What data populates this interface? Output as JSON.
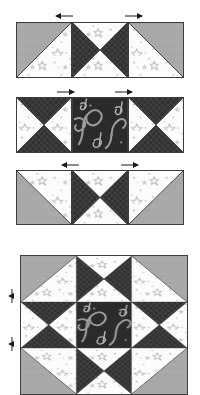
{
  "diagram": {
    "canvas": {
      "width": 200,
      "height": 387,
      "background": "#ffffff"
    }
  },
  "palette": {
    "solid_gray": "#a9a9a9",
    "solid_gray_shadow": "#9a9a9a",
    "white_star_print": "#fbfbfb",
    "star_motif": "#b9b9b9",
    "dark_print": "#3b3b3b",
    "dark_print_texture": "#2a2a2a",
    "music_print_bg": "#2e2e2e",
    "music_print_motif": "#9e9e9e",
    "outline": "#3c3c3c",
    "arrow": "#1a1a1a"
  },
  "fabrics": [
    {
      "id": "gray",
      "name": "solid gray",
      "color": "#a9a9a9"
    },
    {
      "id": "white",
      "name": "white star print",
      "color": "#fbfbfb"
    },
    {
      "id": "dark",
      "name": "dark textured print",
      "color": "#3b3b3b"
    },
    {
      "id": "music",
      "name": "music note print",
      "color": "#2e2e2e"
    }
  ],
  "rows": [
    {
      "id": "row-1",
      "label": "Row 1",
      "y": 22,
      "height": 56,
      "units": [
        {
          "id": "r1-u1",
          "type": "half-square-triangle",
          "name": "half-square-triangle-gray-upper-left",
          "x": 16,
          "width": 56,
          "triangles": [
            {
              "position": "upper-left",
              "fabric": "gray"
            },
            {
              "position": "lower-right",
              "fabric": "white"
            }
          ]
        },
        {
          "id": "r1-u2",
          "type": "hourglass",
          "name": "hourglass-dark-left-right",
          "x": 72,
          "width": 56,
          "triangles": [
            {
              "position": "left",
              "fabric": "dark"
            },
            {
              "position": "right",
              "fabric": "dark"
            },
            {
              "position": "top",
              "fabric": "white"
            },
            {
              "position": "bottom",
              "fabric": "white"
            }
          ]
        },
        {
          "id": "r1-u3",
          "type": "half-square-triangle",
          "name": "half-square-triangle-gray-upper-right",
          "x": 128,
          "width": 56,
          "triangles": [
            {
              "position": "upper-right",
              "fabric": "gray"
            },
            {
              "position": "lower-left",
              "fabric": "white"
            }
          ]
        }
      ],
      "press_arrows": [
        {
          "id": "row-1-arrow-left",
          "direction": "left",
          "x": 58,
          "y": 17
        },
        {
          "id": "row-1-arrow-right",
          "direction": "right",
          "x": 128,
          "y": 17
        }
      ]
    },
    {
      "id": "row-2",
      "label": "Row 2",
      "y": 97,
      "height": 56,
      "units": [
        {
          "id": "r2-u1",
          "type": "hourglass",
          "name": "hourglass-dark-top-bottom-left",
          "x": 16,
          "width": 56,
          "triangles": [
            {
              "position": "top",
              "fabric": "dark"
            },
            {
              "position": "bottom",
              "fabric": "dark"
            },
            {
              "position": "left",
              "fabric": "white"
            },
            {
              "position": "right",
              "fabric": "white"
            }
          ]
        },
        {
          "id": "r2-u2",
          "type": "plain-square",
          "name": "center-square-music-print",
          "x": 72,
          "width": 56,
          "triangles": [
            {
              "position": "whole",
              "fabric": "music"
            }
          ]
        },
        {
          "id": "r2-u3",
          "type": "hourglass",
          "name": "hourglass-dark-top-bottom-right",
          "x": 128,
          "width": 56,
          "triangles": [
            {
              "position": "top",
              "fabric": "dark"
            },
            {
              "position": "bottom",
              "fabric": "dark"
            },
            {
              "position": "left",
              "fabric": "white"
            },
            {
              "position": "right",
              "fabric": "white"
            }
          ]
        }
      ],
      "press_arrows": [
        {
          "id": "row-2-arrow-right-a",
          "direction": "right",
          "x": 60,
          "y": 92
        },
        {
          "id": "row-2-arrow-right-b",
          "direction": "right",
          "x": 118,
          "y": 92
        }
      ]
    },
    {
      "id": "row-3",
      "label": "Row 3",
      "y": 170,
      "height": 55,
      "units": [
        {
          "id": "r3-u1",
          "type": "half-square-triangle",
          "name": "half-square-triangle-gray-lower-left",
          "x": 16,
          "width": 56,
          "triangles": [
            {
              "position": "lower-left",
              "fabric": "gray"
            },
            {
              "position": "upper-right",
              "fabric": "white"
            }
          ]
        },
        {
          "id": "r3-u2",
          "type": "hourglass",
          "name": "hourglass-dark-left-right-lower",
          "x": 72,
          "width": 56,
          "triangles": [
            {
              "position": "left",
              "fabric": "dark"
            },
            {
              "position": "right",
              "fabric": "dark"
            },
            {
              "position": "top",
              "fabric": "white"
            },
            {
              "position": "bottom",
              "fabric": "white"
            }
          ]
        },
        {
          "id": "r3-u3",
          "type": "half-square-triangle",
          "name": "half-square-triangle-gray-lower-right",
          "x": 128,
          "width": 56,
          "triangles": [
            {
              "position": "lower-right",
              "fabric": "gray"
            },
            {
              "position": "upper-left",
              "fabric": "white"
            }
          ]
        }
      ],
      "press_arrows": [
        {
          "id": "row-3-arrow-left",
          "direction": "left",
          "x": 62,
          "y": 165
        },
        {
          "id": "row-3-arrow-right",
          "direction": "right",
          "x": 124,
          "y": 165
        }
      ]
    }
  ],
  "assembled_block": {
    "id": "assembled-star-block",
    "name": "assembled-star-block",
    "label": "Completed star block",
    "x": 20,
    "y": 255,
    "width": 168,
    "height": 140,
    "grid": [
      [
        {
          "type": "half-square-triangle",
          "triangles": [
            {
              "position": "upper-left",
              "fabric": "gray"
            },
            {
              "position": "lower-right",
              "fabric": "white"
            }
          ]
        },
        {
          "type": "hourglass",
          "triangles": [
            {
              "position": "left",
              "fabric": "dark"
            },
            {
              "position": "right",
              "fabric": "dark"
            },
            {
              "position": "top",
              "fabric": "white"
            },
            {
              "position": "bottom",
              "fabric": "white"
            }
          ]
        },
        {
          "type": "half-square-triangle",
          "triangles": [
            {
              "position": "upper-right",
              "fabric": "gray"
            },
            {
              "position": "lower-left",
              "fabric": "white"
            }
          ]
        }
      ],
      [
        {
          "type": "hourglass",
          "triangles": [
            {
              "position": "top",
              "fabric": "dark"
            },
            {
              "position": "bottom",
              "fabric": "dark"
            },
            {
              "position": "left",
              "fabric": "white"
            },
            {
              "position": "right",
              "fabric": "white"
            }
          ]
        },
        {
          "type": "plain-square",
          "triangles": [
            {
              "position": "whole",
              "fabric": "music"
            }
          ]
        },
        {
          "type": "hourglass",
          "triangles": [
            {
              "position": "top",
              "fabric": "dark"
            },
            {
              "position": "bottom",
              "fabric": "dark"
            },
            {
              "position": "left",
              "fabric": "white"
            },
            {
              "position": "right",
              "fabric": "white"
            }
          ]
        }
      ],
      [
        {
          "type": "half-square-triangle",
          "triangles": [
            {
              "position": "lower-left",
              "fabric": "gray"
            },
            {
              "position": "upper-right",
              "fabric": "white"
            }
          ]
        },
        {
          "type": "hourglass",
          "triangles": [
            {
              "position": "left",
              "fabric": "dark"
            },
            {
              "position": "right",
              "fabric": "dark"
            },
            {
              "position": "top",
              "fabric": "white"
            },
            {
              "position": "bottom",
              "fabric": "white"
            }
          ]
        },
        {
          "type": "half-square-triangle",
          "triangles": [
            {
              "position": "lower-right",
              "fabric": "gray"
            },
            {
              "position": "upper-left",
              "fabric": "white"
            }
          ]
        }
      ]
    ],
    "seam_markers": [
      {
        "id": "seam-marker-upper",
        "direction": "up",
        "x": 11,
        "y": 293
      },
      {
        "id": "seam-marker-lower",
        "direction": "down",
        "x": 11,
        "y": 340
      }
    ]
  }
}
